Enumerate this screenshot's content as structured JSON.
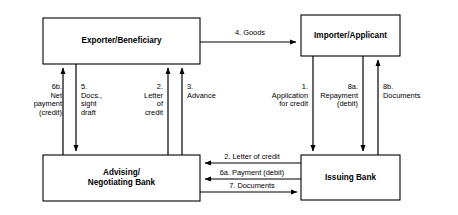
{
  "diagram": {
    "stroke_color": "#000000",
    "fill_color": "#ffffff",
    "background": "#ffffff",
    "nodes": [
      {
        "id": "exporter",
        "label": "Exporter/Beneficiary",
        "x": 43,
        "y": 18,
        "w": 157,
        "h": 46
      },
      {
        "id": "importer",
        "label": "Importer/Applicant",
        "x": 301,
        "y": 15,
        "w": 99,
        "h": 41
      },
      {
        "id": "advising_bank",
        "label": "Advising/\nNegotiating Bank",
        "x": 43,
        "y": 155,
        "w": 157,
        "h": 46
      },
      {
        "id": "issuing_bank",
        "label": "Issuing Bank",
        "x": 301,
        "y": 155,
        "w": 99,
        "h": 45
      }
    ],
    "edges": [
      {
        "id": "goods",
        "step": "4.",
        "label": "4. Goods",
        "from": "exporter",
        "to": "importer",
        "direction": "right"
      },
      {
        "id": "net_payment",
        "step": "6b.",
        "label": "6b.\nNet\npayment\n(credit)",
        "from": "advising_bank",
        "to": "exporter",
        "direction": "up"
      },
      {
        "id": "docs_draft",
        "step": "5.",
        "label": "5.\nDocs.,\nsight\ndraft",
        "from": "exporter",
        "to": "advising_bank",
        "direction": "down"
      },
      {
        "id": "letter_credit_2",
        "step": "2.",
        "label": "2.\nLetter\nof\ncredit",
        "from": "advising_bank",
        "to": "exporter",
        "direction": "up"
      },
      {
        "id": "advance",
        "step": "3.",
        "label": "3.\nAdvance",
        "from": "advising_bank",
        "to": "exporter",
        "direction": "up"
      },
      {
        "id": "application",
        "step": "1.",
        "label": "1.\nApplication\nfor credit",
        "from": "importer",
        "to": "issuing_bank",
        "direction": "down"
      },
      {
        "id": "repayment",
        "step": "8a.",
        "label": "8a.\nRepayment\n(debit)",
        "from": "importer",
        "to": "issuing_bank",
        "direction": "down"
      },
      {
        "id": "documents_8b",
        "step": "8b.",
        "label": "8b.\nDocuments",
        "from": "issuing_bank",
        "to": "importer",
        "direction": "up"
      },
      {
        "id": "letter_credit_bank",
        "step": "2.",
        "label": "2.   Letter of credit",
        "from": "issuing_bank",
        "to": "advising_bank",
        "direction": "left"
      },
      {
        "id": "payment_debit",
        "step": "6a.",
        "label": "6a. Payment (debit)",
        "from": "issuing_bank",
        "to": "advising_bank",
        "direction": "left"
      },
      {
        "id": "documents_7",
        "step": "7.",
        "label": "7.   Documents",
        "from": "advising_bank",
        "to": "issuing_bank",
        "direction": "right"
      }
    ]
  }
}
